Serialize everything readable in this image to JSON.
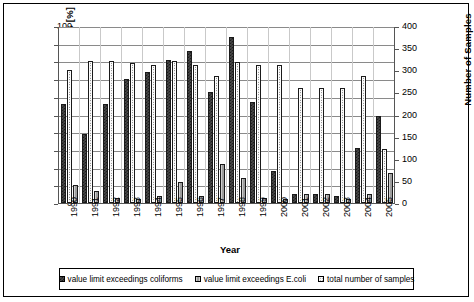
{
  "chart_data": {
    "type": "bar",
    "title": "",
    "xlabel": "Year",
    "ylabel": "limit exceedings [%]",
    "ylabel_secondary": "Number of Samples",
    "ylim": [
      0,
      100
    ],
    "ylim_secondary": [
      0,
      400
    ],
    "yticks": [
      0,
      10,
      20,
      30,
      40,
      50,
      60,
      70,
      80,
      90,
      100
    ],
    "yticks_secondary": [
      0,
      50,
      100,
      150,
      200,
      250,
      300,
      350,
      400
    ],
    "grid": true,
    "legend_position": "bottom",
    "categories": [
      "1990",
      "1991",
      "1992",
      "1993",
      "1994",
      "1995",
      "1996",
      "1997",
      "1998",
      "1999",
      "2000",
      "2001",
      "2002",
      "2003",
      "2004",
      "2005"
    ],
    "series": [
      {
        "name": "value limit exceedings coliforms",
        "axis": "left",
        "unit": "%",
        "values": [
          56,
          39,
          56,
          70,
          74,
          81,
          86,
          63,
          94,
          57,
          18,
          5,
          5,
          4,
          31,
          49
        ]
      },
      {
        "name": "value limit exceedings E.coli",
        "axis": "left",
        "unit": "%",
        "values": [
          10,
          7,
          3,
          2,
          4,
          12,
          4,
          22,
          14,
          3,
          2,
          5,
          5,
          2,
          5,
          17
        ]
      },
      {
        "name": "total number of samples",
        "axis": "right",
        "unit": "samples",
        "values": [
          300,
          320,
          320,
          316,
          313,
          320,
          313,
          286,
          319,
          313,
          312,
          260,
          260,
          260,
          288,
          122
        ]
      }
    ],
    "series_percent_equivalent_samples": [
      75,
      80,
      80,
      79,
      78,
      80,
      78,
      71.5,
      79.8,
      78,
      78,
      65,
      65,
      65,
      72,
      30.5
    ]
  },
  "legend": {
    "items": [
      {
        "label": "value limit exceedings coliforms",
        "swatch": "dark-checker"
      },
      {
        "label": "value limit exceedings E.coli",
        "swatch": "grey"
      },
      {
        "label": "total number of samples",
        "swatch": "white-dotted"
      }
    ]
  }
}
